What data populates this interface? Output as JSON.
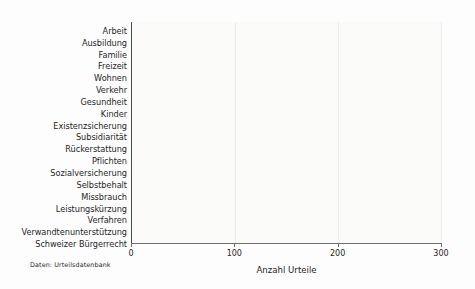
{
  "chart_data": {
    "type": "bar",
    "orientation": "horizontal",
    "title": "",
    "xlabel": "Anzahl Urteile",
    "ylabel": "",
    "xlim": [
      0,
      310
    ],
    "xticks": [
      0,
      100,
      200,
      300
    ],
    "xtick_labels": [
      "0",
      "100",
      "200",
      "300"
    ],
    "grid": false,
    "legend": null,
    "bar_color": "#1b1b1b",
    "categories": [
      "Arbeit",
      "Ausbildung",
      "Familie",
      "Freizeit",
      "Wohnen",
      "Verkehr",
      "Gesundheit",
      "Kinder",
      "Existenzsicherung",
      "Subsidiarität",
      "Rückerstattung",
      "Pflichten",
      "Sozialversicherung",
      "Selbstbehalt",
      "Missbrauch",
      "Leistungskürzung",
      "Verfahren",
      "Verwandtenunterstützung",
      "Schweizer Bürgerrecht"
    ],
    "values": [
      234,
      138,
      101,
      102,
      92,
      51,
      39,
      5,
      287,
      175,
      174,
      90,
      49,
      48,
      33,
      31,
      31,
      26,
      7
    ]
  },
  "annotations": {
    "source_note": "Daten: Urteilsdatenbank"
  }
}
